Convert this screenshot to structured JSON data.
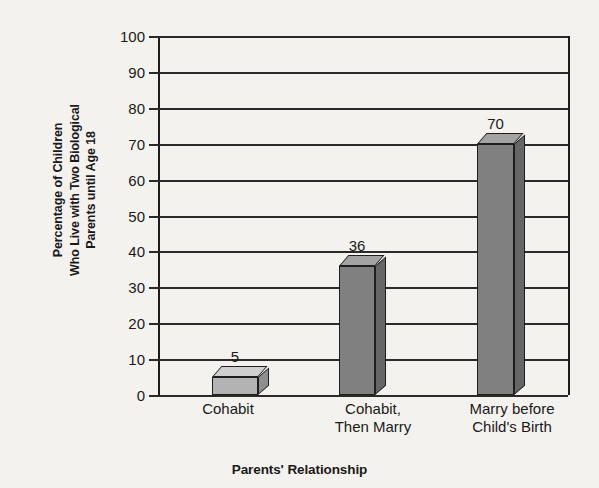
{
  "chart_data": {
    "type": "bar",
    "title": "",
    "categories": [
      "Cohabit",
      "Cohabit, Then Marry",
      "Marry before Child's Birth"
    ],
    "category_lines": [
      [
        "Cohabit"
      ],
      [
        "Cohabit,",
        "Then Marry"
      ],
      [
        "Marry before",
        "Child's Birth"
      ]
    ],
    "values": [
      5,
      36,
      70
    ],
    "value_labels": [
      "5",
      "36",
      "70"
    ],
    "xlabel": "Parents' Relationship",
    "ylabel": "Percentage of Children Who Live with Two Biological Parents until Age 18",
    "ylabel_lines": [
      "Percentage of Children",
      "Who Live with Two Biological",
      "Parents until Age 18"
    ],
    "ylim": [
      0,
      100
    ],
    "ytick_labels": [
      "100",
      "90",
      "80",
      "70",
      "60",
      "50",
      "40",
      "30",
      "20",
      "10",
      "0"
    ],
    "ytick_values": [
      100,
      90,
      80,
      70,
      60,
      50,
      40,
      30,
      20,
      10,
      0
    ],
    "ytick_step": 10,
    "grid": true,
    "legend": false,
    "style": "3d-block-bars",
    "colors": {
      "background": "#f4f2ee",
      "axis": "#1c1c1c",
      "gridline": "#2a2a2a",
      "bar_front_light": "#b3b3b3",
      "bar_top_light": "#cfcfcf",
      "bar_side_light": "#8f8f8f",
      "bar_front_dark": "#808080",
      "bar_top_dark": "#a3a3a3",
      "bar_side_dark": "#666666",
      "text": "#1a1a1a"
    },
    "bar_styles": [
      "light",
      "dark",
      "dark"
    ]
  }
}
